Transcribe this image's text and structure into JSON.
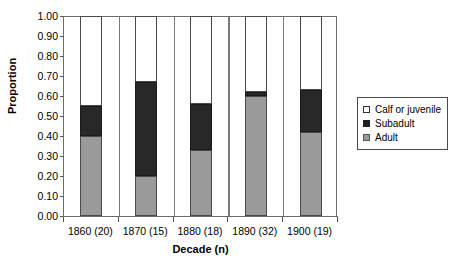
{
  "chart_data": {
    "type": "bar",
    "subtype": "stacked-bar-proportional",
    "title": "",
    "xlabel": "Decade (n)",
    "ylabel": "Proportion",
    "categories": [
      "1860 (20)",
      "1870 (15)",
      "1880 (18)",
      "1890 (32)",
      "1900 (19)"
    ],
    "series": [
      {
        "name": "Adult",
        "color": "#9a9a9a",
        "values": [
          0.4,
          0.2,
          0.33,
          0.6,
          0.42
        ]
      },
      {
        "name": "Subadult",
        "color": "#282828",
        "values": [
          0.15,
          0.47,
          0.23,
          0.02,
          0.21
        ]
      },
      {
        "name": "Calf or juvenile",
        "color": "#ffffff",
        "values": [
          0.45,
          0.33,
          0.44,
          0.38,
          0.37
        ]
      }
    ],
    "cumulative_tops": {
      "adult": [
        0.4,
        0.2,
        0.33,
        0.6,
        0.42
      ],
      "adult_plus_subadult": [
        0.55,
        0.67,
        0.56,
        0.62,
        0.63
      ]
    },
    "ylim": [
      0.0,
      1.0
    ],
    "ytick_values": [
      0.0,
      0.1,
      0.2,
      0.3,
      0.4,
      0.5,
      0.6,
      0.7,
      0.8,
      0.9,
      1.0
    ],
    "ytick_labels": [
      "0.00",
      "0.10",
      "0.20",
      "0.30",
      "0.40",
      "0.50",
      "0.60",
      "0.70",
      "0.80",
      "0.90",
      "1.00"
    ],
    "grid": "vertical-category-separators",
    "legend_position": "right",
    "legend_entries": [
      "Calf or juvenile",
      "Subadult",
      "Adult"
    ]
  },
  "axes": {
    "y_title": "Proportion",
    "x_title": "Decade (n)"
  },
  "legend": {
    "items": [
      {
        "label": "Calf or juvenile",
        "swatch": "white-square-icon"
      },
      {
        "label": "Subadult",
        "swatch": "black-square-icon"
      },
      {
        "label": "Adult",
        "swatch": "gray-square-icon"
      }
    ]
  },
  "colors": {
    "adult": "#9a9a9a",
    "subadult": "#282828",
    "calf": "#ffffff",
    "axis": "#6b6b6b"
  }
}
